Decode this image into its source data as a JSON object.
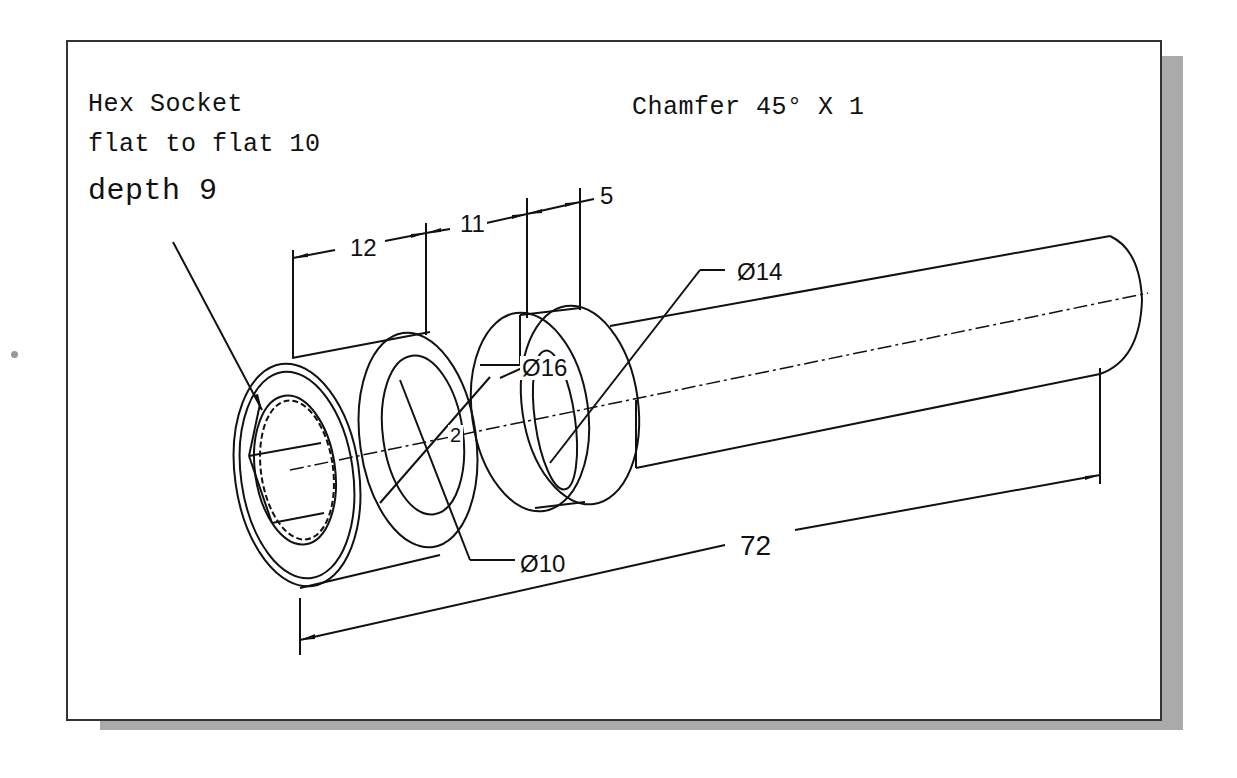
{
  "figure": {
    "type": "isometric technical drawing"
  },
  "notes": {
    "hex_socket_line1": "Hex Socket",
    "hex_socket_line2": "flat to flat 10",
    "hex_socket_line3": "depth 9",
    "chamfer": "Chamfer 45° X 1"
  },
  "dimensions": {
    "len_head": "12",
    "len_gap": "11",
    "len_collar": "5",
    "total_length": "72",
    "dia_shaft": "Ø14",
    "dia_collar": "Ø16",
    "dia_head": "Ø10",
    "radius_small": "2"
  },
  "colors": {
    "line": "#111111",
    "frame_border": "#333333",
    "shadow": "#aaaaaa",
    "background": "#ffffff"
  }
}
